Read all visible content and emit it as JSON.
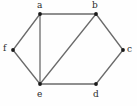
{
  "figure": {
    "name": "undirected-graph-diagram",
    "width": 137,
    "height": 106,
    "background_color": "#fefefe",
    "edge_color": "#6b6b6b",
    "vertex_color": "#1a1a1a",
    "label_color": "#2b2b2b"
  },
  "chart_data": {
    "type": "diagram",
    "subtype": "undirected-graph",
    "title": "",
    "xlabel": "",
    "ylabel": "",
    "grid": false,
    "legend": "none",
    "nodes": [
      {
        "id": "a",
        "label": "a",
        "x": 40,
        "y": 14,
        "label_x": 37,
        "label_y": 1,
        "label_pos": "above"
      },
      {
        "id": "b",
        "label": "b",
        "x": 96,
        "y": 14,
        "label_x": 92,
        "label_y": 1,
        "label_pos": "above"
      },
      {
        "id": "c",
        "label": "c",
        "x": 123,
        "y": 50,
        "label_x": 127,
        "label_y": 45,
        "label_pos": "right"
      },
      {
        "id": "d",
        "label": "d",
        "x": 96,
        "y": 84,
        "label_x": 93,
        "label_y": 90,
        "label_pos": "below"
      },
      {
        "id": "e",
        "label": "e",
        "x": 40,
        "y": 84,
        "label_x": 37,
        "label_y": 90,
        "label_pos": "below"
      },
      {
        "id": "f",
        "label": "f",
        "x": 13,
        "y": 50,
        "label_x": 3,
        "label_y": 44,
        "label_pos": "left"
      }
    ],
    "edges": [
      {
        "source": "a",
        "target": "b"
      },
      {
        "source": "a",
        "target": "e"
      },
      {
        "source": "a",
        "target": "f"
      },
      {
        "source": "f",
        "target": "e"
      },
      {
        "source": "e",
        "target": "b"
      },
      {
        "source": "e",
        "target": "d"
      },
      {
        "source": "b",
        "target": "c"
      },
      {
        "source": "c",
        "target": "d"
      }
    ],
    "node_count": 6,
    "edge_count": 8
  }
}
